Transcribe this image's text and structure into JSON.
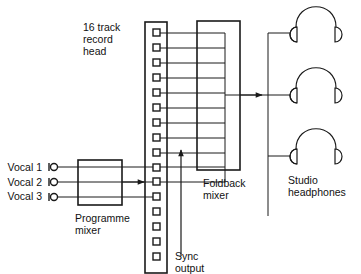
{
  "labels": {
    "record_head": "16 track\nrecord\nhead",
    "foldback_mixer": "Foldback\nmixer",
    "programme_mixer": "Programme\nmixer",
    "studio_headphones": "Studio\nheadphones",
    "sync_output": "Sync\noutput"
  },
  "vocals": [
    "Vocal 1",
    "Vocal 2",
    "Vocal 3"
  ],
  "record_head": {
    "track_count": 16,
    "foldback_tracks": 11,
    "recorded_tracks": [
      11,
      12,
      13
    ]
  },
  "headphones_count": 3,
  "colors": {
    "line": "#1a1a1a",
    "background": "#ffffff"
  }
}
